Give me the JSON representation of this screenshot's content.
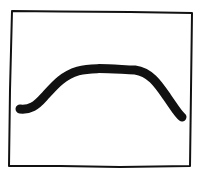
{
  "sketch": {
    "description": "Hand-drawn rectangle frame containing a thick arch-shaped curve",
    "colors": {
      "background": "#ffffff",
      "ink": "#111111"
    },
    "frame": {
      "points": [
        [
          12,
          11
        ],
        [
          192,
          13
        ],
        [
          190,
          166
        ],
        [
          9,
          166
        ]
      ],
      "stroke_width": 2
    },
    "curve": {
      "shape": "arch",
      "start": [
        20,
        110
      ],
      "plateau": [
        [
          80,
          70
        ],
        [
          135,
          71
        ]
      ],
      "end": [
        183,
        118
      ],
      "stroke_width": 9
    }
  }
}
